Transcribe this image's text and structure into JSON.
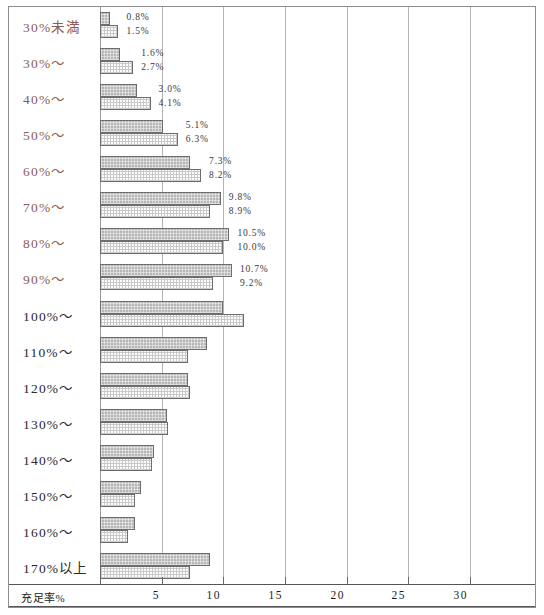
{
  "chart_data": {
    "type": "bar",
    "orientation": "horizontal",
    "title": "",
    "xlabel": "充足率%",
    "ylabel": "",
    "xlim": [
      0,
      34
    ],
    "xticks": [
      5,
      10,
      15,
      20,
      25,
      30
    ],
    "xtick_labels": [
      "5",
      "10",
      "15",
      "20",
      "25",
      "30"
    ],
    "grid": true,
    "legend": "none",
    "categories": [
      "30%未満",
      "30%～",
      "40%～",
      "50%～",
      "60%～",
      "70%～",
      "80%～",
      "90%～",
      "100%～",
      "110%～",
      "120%～",
      "130%～",
      "140%～",
      "150%～",
      "160%～",
      "170%以上"
    ],
    "highlighted_categories": [
      "30%未満",
      "30%～",
      "40%～",
      "50%～",
      "60%～",
      "70%～",
      "80%～",
      "90%～"
    ],
    "series": [
      {
        "name": "series-a",
        "pattern": "grey-crosshatch",
        "values": [
          0.8,
          1.6,
          3.0,
          5.1,
          7.3,
          9.8,
          10.5,
          10.7,
          10.0,
          8.7,
          7.1,
          5.4,
          4.4,
          3.3,
          2.8,
          8.9
        ]
      },
      {
        "name": "series-b",
        "pattern": "white-dotted",
        "values": [
          1.5,
          2.7,
          4.1,
          6.3,
          8.2,
          8.9,
          10.0,
          9.2,
          11.7,
          7.1,
          7.3,
          5.5,
          4.2,
          2.8,
          2.3,
          7.3
        ]
      }
    ],
    "data_labels": [
      {
        "category": "30%未満",
        "a": "0.8%",
        "b": "1.5%"
      },
      {
        "category": "30%～",
        "a": "1.6%",
        "b": "2.7%"
      },
      {
        "category": "40%～",
        "a": "3.0%",
        "b": "4.1%"
      },
      {
        "category": "50%～",
        "a": "5.1%",
        "b": "6.3%"
      },
      {
        "category": "60%～",
        "a": "7.3%",
        "b": "8.2%"
      },
      {
        "category": "70%～",
        "a": "9.8%",
        "b": "8.9%"
      },
      {
        "category": "80%～",
        "a": "10.5%",
        "b": "10.0%"
      },
      {
        "category": "90%～",
        "a": "10.7%",
        "b": "9.2%"
      },
      {
        "category": "100%～",
        "a": "",
        "b": ""
      },
      {
        "category": "110%～",
        "a": "",
        "b": ""
      },
      {
        "category": "120%～",
        "a": "",
        "b": ""
      },
      {
        "category": "130%～",
        "a": "",
        "b": ""
      },
      {
        "category": "140%～",
        "a": "",
        "b": ""
      },
      {
        "category": "150%～",
        "a": "",
        "b": ""
      },
      {
        "category": "160%～",
        "a": "",
        "b": ""
      },
      {
        "category": "170%以上",
        "a": "",
        "b": ""
      }
    ],
    "colors": {
      "series_a_fill": "#b6b6b6",
      "series_b_fill": "#fbfbfb",
      "bar_border": "#6d6d6d",
      "gridline": "#b4b4b4",
      "frame": "#8d8d8d",
      "label_highlight": "#8c5a52",
      "label_normal": "#2a2a2a"
    }
  }
}
